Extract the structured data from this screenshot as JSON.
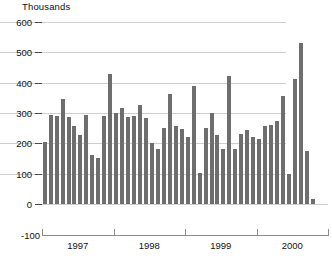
{
  "chart_data": {
    "type": "bar",
    "title": "",
    "unit_label": "Thousands",
    "xlabel": "",
    "ylabel": "",
    "ylim": [
      -100,
      600
    ],
    "yticks": [
      -100,
      0,
      100,
      200,
      300,
      400,
      500,
      600
    ],
    "ytick_labels": [
      "-100",
      "0",
      "100",
      "200",
      "300",
      "400",
      "500",
      "600"
    ],
    "grid": "horizontal",
    "legend": "none",
    "bar_color": "#6e6e6e",
    "x_tick_labels": [
      "1997",
      "1998",
      "1999",
      "2000"
    ],
    "x_tick_boundaries": [
      "1997",
      "1998",
      "1999",
      "2000",
      "2001"
    ],
    "categories": [
      "1997-01",
      "1997-02",
      "1997-03",
      "1997-04",
      "1997-05",
      "1997-06",
      "1997-07",
      "1997-08",
      "1997-09",
      "1997-10",
      "1997-11",
      "1997-12",
      "1998-01",
      "1998-02",
      "1998-03",
      "1998-04",
      "1998-05",
      "1998-06",
      "1998-07",
      "1998-08",
      "1998-09",
      "1998-10",
      "1998-11",
      "1998-12",
      "1999-01",
      "1999-02",
      "1999-03",
      "1999-04",
      "1999-05",
      "1999-06",
      "1999-07",
      "1999-08",
      "1999-09",
      "1999-10",
      "1999-11",
      "1999-12",
      "2000-01",
      "2000-02",
      "2000-03",
      "2000-04",
      "2000-05",
      "2000-06",
      "2000-07",
      "2000-08",
      "2000-09",
      "2000-10",
      "2000-11",
      "2000-12"
    ],
    "values": [
      205,
      293,
      290,
      345,
      288,
      258,
      228,
      295,
      162,
      152,
      290,
      430,
      300,
      318,
      286,
      290,
      326,
      284,
      200,
      182,
      250,
      362,
      258,
      248,
      222,
      388,
      102,
      250,
      300,
      228,
      182,
      424,
      180,
      232,
      244,
      220,
      216,
      256,
      262,
      274,
      358,
      100,
      412,
      530,
      175,
      15,
      0,
      0
    ]
  }
}
